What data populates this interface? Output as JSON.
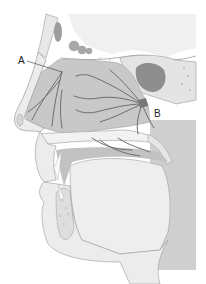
{
  "figure": {
    "labels": [
      {
        "id": "A",
        "text": "A",
        "x": 18,
        "y": 57
      },
      {
        "id": "B",
        "text": "B",
        "x": 154,
        "y": 110
      }
    ],
    "colors": {
      "background": "#ffffff",
      "tissue_light": "#eeeeee",
      "tissue_mid": "#d2d2d2",
      "cavity": "#c4c4c4",
      "bone_outline": "#9a9a9a",
      "nerve": "#6e6e6e",
      "sinus_dark": "#8a8a8a",
      "dark_region": "#bdbdbd"
    }
  }
}
